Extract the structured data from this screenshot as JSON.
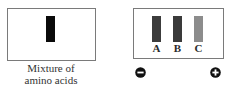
{
  "figure": {
    "mixture_panel": {
      "caption_line1": "Mixture of",
      "caption_line2": "amino acids",
      "band_color": "#0a0a0a"
    },
    "separated_panel": {
      "bands": [
        {
          "label": "A",
          "color": "#3c3c3c"
        },
        {
          "label": "B",
          "color": "#3a3a3a"
        },
        {
          "label": "C",
          "color": "#8c8c8c"
        }
      ]
    },
    "electrodes": {
      "negative": {
        "symbol": "minus",
        "icon": "minus-circle-icon"
      },
      "positive": {
        "symbol": "plus",
        "icon": "plus-circle-icon"
      }
    }
  }
}
